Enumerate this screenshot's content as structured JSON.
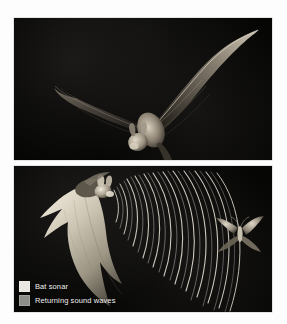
{
  "figure": {
    "background_color": "#ffffff",
    "panel_background_color": "#050505"
  },
  "panels": [
    {
      "id": "bat-in-flight",
      "caption": "",
      "subject": "bat-in-flight-photo",
      "background_color": "#050505",
      "subject_color": "#b9b2a6"
    },
    {
      "id": "echolocation-diagram",
      "caption": "",
      "subject": "bat-hunting-moth-diagram",
      "background_color": "#050505",
      "subject_color": "#cfc8b8"
    }
  ],
  "legend": {
    "position": "bottom-left",
    "items": [
      {
        "label": "Bat sonar",
        "color": "#e9e7e0",
        "swatch_name": "legend-swatch-bat-sonar"
      },
      {
        "label": "Returning sound waves",
        "color": "#8d8d8a",
        "swatch_name": "legend-swatch-returning-sound-waves"
      }
    ]
  },
  "diagram": {
    "emitter": "bat",
    "target": "moth",
    "outgoing_wave_count": 17,
    "returning_wave_count": 6,
    "wave_color_outgoing": "#ded9ce",
    "wave_color_returning": "#8d8d8a"
  }
}
